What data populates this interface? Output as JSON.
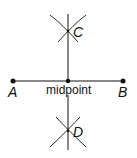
{
  "diagram": {
    "points": {
      "A": {
        "label": "A",
        "x": 13,
        "y": 81
      },
      "B": {
        "label": "B",
        "x": 123,
        "y": 81
      },
      "M": {
        "label": "midpoint",
        "x": 68,
        "y": 81
      },
      "C": {
        "label": "C",
        "x": 68,
        "y": 31
      },
      "D": {
        "label": "D",
        "x": 68,
        "y": 131
      }
    },
    "segments": [
      {
        "name": "AB",
        "from": "A",
        "to": "B"
      },
      {
        "name": "perpendicular-bisector",
        "from": "C",
        "to": "D"
      }
    ],
    "colors": {
      "stroke": "#111111",
      "background": "#ffffff"
    }
  }
}
